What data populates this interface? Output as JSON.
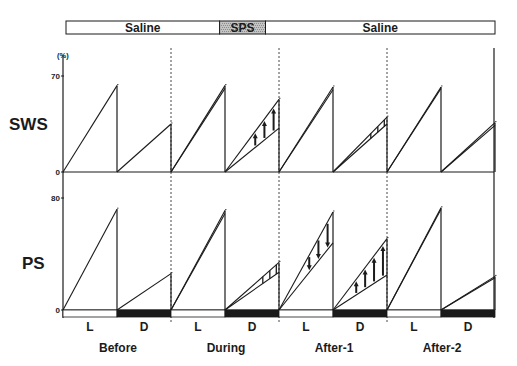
{
  "chart_data": {
    "type": "line",
    "title": "",
    "xlabel": "",
    "unit_label": "(%)",
    "grid": false,
    "conditions": [
      "Before",
      "During",
      "After-1",
      "After-2"
    ],
    "phases": [
      "L",
      "D"
    ],
    "treatment_bar": [
      {
        "label": "Saline",
        "from_phase": 0,
        "to_phase": 2.9,
        "shaded": false
      },
      {
        "label": "SPS",
        "from_phase": 2.9,
        "to_phase": 3.75,
        "shaded": true
      },
      {
        "label": "Saline",
        "from_phase": 3.75,
        "to_phase": 8,
        "shaded": false
      }
    ],
    "light_dark_bar": [
      "L",
      "D",
      "L",
      "D",
      "L",
      "D",
      "L",
      "D"
    ],
    "panels": [
      {
        "name": "SWS",
        "ylabel": "SWS",
        "ylim": [
          0,
          85
        ],
        "yticks": [
          0,
          70
        ],
        "segments": [
          {
            "condition": "Before",
            "phase": "L",
            "upper": 63,
            "lower": 63,
            "marker": "none"
          },
          {
            "condition": "Before",
            "phase": "D",
            "upper": 35,
            "lower": 35,
            "marker": "none"
          },
          {
            "condition": "During",
            "phase": "L",
            "upper": 63,
            "lower": 61,
            "marker": "none"
          },
          {
            "condition": "During",
            "phase": "D",
            "upper": 53,
            "lower": 32,
            "marker": "arrows-up",
            "arrow_count": 3
          },
          {
            "condition": "After-1",
            "phase": "L",
            "upper": 62,
            "lower": 60,
            "marker": "none"
          },
          {
            "condition": "After-1",
            "phase": "D",
            "upper": 40,
            "lower": 35,
            "marker": "hatch"
          },
          {
            "condition": "After-2",
            "phase": "L",
            "upper": 62,
            "lower": 61,
            "marker": "none"
          },
          {
            "condition": "After-2",
            "phase": "D",
            "upper": 36,
            "lower": 34,
            "marker": "none"
          }
        ]
      },
      {
        "name": "PS",
        "ylabel": "PS",
        "ylim": [
          0,
          98
        ],
        "yticks": [
          0,
          80
        ],
        "segments": [
          {
            "condition": "Before",
            "phase": "L",
            "upper": 72,
            "lower": 72,
            "marker": "none"
          },
          {
            "condition": "Before",
            "phase": "D",
            "upper": 26,
            "lower": 26,
            "marker": "none"
          },
          {
            "condition": "During",
            "phase": "L",
            "upper": 71,
            "lower": 69,
            "marker": "none"
          },
          {
            "condition": "During",
            "phase": "D",
            "upper": 34,
            "lower": 27,
            "marker": "hatch"
          },
          {
            "condition": "After-1",
            "phase": "L",
            "upper": 70,
            "lower": 48,
            "marker": "arrows-down",
            "arrow_count": 3
          },
          {
            "condition": "After-1",
            "phase": "D",
            "upper": 51,
            "lower": 25,
            "marker": "arrows-up",
            "arrow_count": 4
          },
          {
            "condition": "After-2",
            "phase": "L",
            "upper": 73,
            "lower": 72,
            "marker": "none"
          },
          {
            "condition": "After-2",
            "phase": "D",
            "upper": 24,
            "lower": 23,
            "marker": "none"
          }
        ]
      }
    ],
    "colors": {
      "line": "#1b1b1b",
      "dark_phase": "#1a1a1a",
      "light_phase": "#ffffff",
      "sps_shade": "#c4c4c4"
    }
  }
}
